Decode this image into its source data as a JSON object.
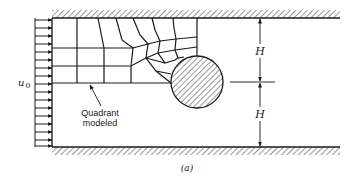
{
  "figure": {
    "caption": "(a)",
    "inlet_label": "u",
    "inlet_subscript": "0",
    "annotation": {
      "line1": "Quadrant",
      "line2": "modeled"
    },
    "dimensions": {
      "upper_label": "H",
      "lower_label": "H"
    },
    "colors": {
      "stroke": "#1a1a1a",
      "background": "#ffffff"
    }
  }
}
